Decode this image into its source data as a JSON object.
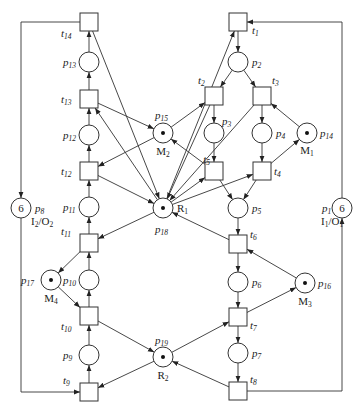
{
  "diagram": {
    "type": "petri-net",
    "colors": {
      "stroke": "#333333",
      "fill": "#ffffff",
      "token": "#111111"
    },
    "places": [
      {
        "id": "p1",
        "x": 342,
        "y": 208,
        "tokens": "6",
        "label": "p",
        "sub": "1",
        "role": "I",
        "roleSub": "1",
        "role2": "O",
        "role2Sub": "1"
      },
      {
        "id": "p2",
        "x": 238,
        "y": 62,
        "label": "p",
        "sub": "2"
      },
      {
        "id": "p3",
        "x": 214,
        "y": 133,
        "label": "p",
        "sub": "3"
      },
      {
        "id": "p4",
        "x": 262,
        "y": 133,
        "label": "p",
        "sub": "4"
      },
      {
        "id": "p5",
        "x": 238,
        "y": 208,
        "label": "p",
        "sub": "5"
      },
      {
        "id": "p6",
        "x": 238,
        "y": 282,
        "label": "p",
        "sub": "6"
      },
      {
        "id": "p7",
        "x": 238,
        "y": 353,
        "label": "p",
        "sub": "7"
      },
      {
        "id": "p8",
        "x": 21,
        "y": 208,
        "tokens": "6",
        "label": "p",
        "sub": "8",
        "role": "I",
        "roleSub": "2",
        "role2": "O",
        "role2Sub": "2"
      },
      {
        "id": "p9",
        "x": 89,
        "y": 355,
        "label": "p",
        "sub": "9"
      },
      {
        "id": "p10",
        "x": 89,
        "y": 280,
        "label": "p",
        "sub": "10"
      },
      {
        "id": "p11",
        "x": 89,
        "y": 207,
        "label": "p",
        "sub": "11"
      },
      {
        "id": "p12",
        "x": 89,
        "y": 135,
        "label": "p",
        "sub": "12"
      },
      {
        "id": "p13",
        "x": 89,
        "y": 62,
        "label": "p",
        "sub": "13"
      },
      {
        "id": "p14",
        "x": 307,
        "y": 133,
        "dot": true,
        "label": "p",
        "sub": "14",
        "res": "M",
        "resSub": "1"
      },
      {
        "id": "p15",
        "x": 163,
        "y": 133,
        "dot": true,
        "label": "p",
        "sub": "15",
        "res": "M",
        "resSub": "2"
      },
      {
        "id": "p16",
        "x": 305,
        "y": 283,
        "dot": true,
        "label": "p",
        "sub": "16",
        "res": "M",
        "resSub": "3"
      },
      {
        "id": "p17",
        "x": 51,
        "y": 280,
        "dot": true,
        "label": "p",
        "sub": "17",
        "res": "M",
        "resSub": "4"
      },
      {
        "id": "p18",
        "x": 163,
        "y": 208,
        "dot": true,
        "label": "p",
        "sub": "18",
        "res": "R",
        "resSub": "1"
      },
      {
        "id": "p19",
        "x": 163,
        "y": 357,
        "dot": true,
        "label": "p",
        "sub": "19",
        "res": "R",
        "resSub": "2"
      }
    ],
    "transitions": [
      {
        "id": "t1",
        "x": 238,
        "y": 22,
        "label": "t",
        "sub": "1"
      },
      {
        "id": "t2",
        "x": 214,
        "y": 96,
        "label": "t",
        "sub": "2"
      },
      {
        "id": "t3",
        "x": 262,
        "y": 96,
        "label": "t",
        "sub": "3"
      },
      {
        "id": "t4",
        "x": 262,
        "y": 171,
        "label": "t",
        "sub": "4"
      },
      {
        "id": "t5",
        "x": 214,
        "y": 171,
        "label": "t",
        "sub": "5"
      },
      {
        "id": "t6",
        "x": 238,
        "y": 244,
        "label": "t",
        "sub": "6"
      },
      {
        "id": "t7",
        "x": 238,
        "y": 317,
        "label": "t",
        "sub": "7"
      },
      {
        "id": "t8",
        "x": 238,
        "y": 391,
        "label": "t",
        "sub": "8"
      },
      {
        "id": "t9",
        "x": 89,
        "y": 392,
        "label": "t",
        "sub": "9"
      },
      {
        "id": "t10",
        "x": 89,
        "y": 316,
        "label": "t",
        "sub": "10"
      },
      {
        "id": "t11",
        "x": 89,
        "y": 243,
        "label": "t",
        "sub": "11"
      },
      {
        "id": "t12",
        "x": 89,
        "y": 171,
        "label": "t",
        "sub": "12"
      },
      {
        "id": "t13",
        "x": 89,
        "y": 99,
        "label": "t",
        "sub": "13"
      },
      {
        "id": "t14",
        "x": 89,
        "y": 22,
        "label": "t",
        "sub": "14"
      }
    ],
    "arcs": [
      [
        "p1",
        "t1"
      ],
      [
        "t1",
        "p2"
      ],
      [
        "p2",
        "t2"
      ],
      [
        "p2",
        "t3"
      ],
      [
        "t2",
        "p3"
      ],
      [
        "t3",
        "p4"
      ],
      [
        "p3",
        "t5"
      ],
      [
        "p4",
        "t4"
      ],
      [
        "t5",
        "p5"
      ],
      [
        "t4",
        "p5"
      ],
      [
        "p5",
        "t6"
      ],
      [
        "t6",
        "p6"
      ],
      [
        "p6",
        "t7"
      ],
      [
        "t7",
        "p7"
      ],
      [
        "p7",
        "t8"
      ],
      [
        "t8",
        "p1"
      ],
      [
        "p8",
        "t9"
      ],
      [
        "t9",
        "p9"
      ],
      [
        "p9",
        "t10"
      ],
      [
        "t10",
        "p10"
      ],
      [
        "p10",
        "t11"
      ],
      [
        "t11",
        "p11"
      ],
      [
        "p11",
        "t12"
      ],
      [
        "t12",
        "p12"
      ],
      [
        "p12",
        "t13"
      ],
      [
        "t13",
        "p13"
      ],
      [
        "p13",
        "t14"
      ],
      [
        "t14",
        "p8"
      ],
      [
        "p14",
        "t3"
      ],
      [
        "t4",
        "p14"
      ],
      [
        "p15",
        "t2"
      ],
      [
        "t5",
        "p15"
      ],
      [
        "t13",
        "p15"
      ],
      [
        "p15",
        "t12"
      ],
      [
        "p16",
        "t6"
      ],
      [
        "t7",
        "p16"
      ],
      [
        "p17",
        "t10"
      ],
      [
        "t11",
        "p17"
      ],
      [
        "p18",
        "t1"
      ],
      [
        "p18",
        "t13"
      ],
      [
        "p18",
        "t5"
      ],
      [
        "p18",
        "t4"
      ],
      [
        "p18",
        "t11"
      ],
      [
        "t14",
        "p18"
      ],
      [
        "t12",
        "p18"
      ],
      [
        "t2",
        "p18"
      ],
      [
        "t3",
        "p18"
      ],
      [
        "t6",
        "p18"
      ],
      [
        "p19",
        "t7"
      ],
      [
        "p19",
        "t9"
      ],
      [
        "t10",
        "p19"
      ],
      [
        "t8",
        "p19"
      ]
    ]
  }
}
